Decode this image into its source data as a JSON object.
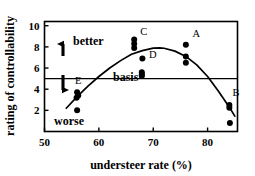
{
  "chart_data": {
    "type": "scatter",
    "title": "",
    "xlabel": "understeer rate (%)",
    "ylabel": "rating of controllability",
    "xlim": [
      50,
      85.5
    ],
    "ylim": [
      0,
      10.4
    ],
    "xticks": [
      50,
      60,
      70,
      80
    ],
    "yticks": [
      2,
      4,
      6,
      8,
      10
    ],
    "xtick_labels": [
      "50",
      "60",
      "70",
      "80"
    ],
    "ytick_labels": [
      "2",
      "4",
      "6",
      "8",
      "10"
    ],
    "grid": false,
    "legend": "none",
    "reference_line": {
      "label": "basis",
      "orientation": "horizontal",
      "y": 5.0
    },
    "direction_annotations": [
      {
        "label": "better",
        "direction": "up"
      },
      {
        "label": "worse",
        "direction": "down"
      }
    ],
    "groups": [
      {
        "name": "E",
        "x": 56.0,
        "values": [
          3.7,
          3.4,
          3.2,
          2.0
        ]
      },
      {
        "name": "C",
        "x": 66.5,
        "values": [
          8.7,
          8.3,
          7.9
        ]
      },
      {
        "name": "D",
        "x": 68.0,
        "values": [
          6.9,
          5.6,
          5.4,
          5.25
        ]
      },
      {
        "name": "A",
        "x": 76.0,
        "values": [
          8.2,
          7.1,
          6.5
        ]
      },
      {
        "name": "B",
        "x": 84.0,
        "values": [
          2.5,
          2.25,
          0.8
        ]
      }
    ],
    "points": [
      {
        "x": 56.0,
        "y": 3.7,
        "group": "E"
      },
      {
        "x": 56.2,
        "y": 3.4,
        "group": "E"
      },
      {
        "x": 55.9,
        "y": 3.2,
        "group": "E"
      },
      {
        "x": 56.0,
        "y": 2.0,
        "group": "E"
      },
      {
        "x": 66.5,
        "y": 8.7,
        "group": "C"
      },
      {
        "x": 66.5,
        "y": 8.3,
        "group": "C"
      },
      {
        "x": 66.5,
        "y": 7.9,
        "group": "C"
      },
      {
        "x": 68.0,
        "y": 6.9,
        "group": "D"
      },
      {
        "x": 67.9,
        "y": 5.6,
        "group": "D"
      },
      {
        "x": 67.9,
        "y": 5.4,
        "group": "D"
      },
      {
        "x": 67.9,
        "y": 5.25,
        "group": "D"
      },
      {
        "x": 76.0,
        "y": 8.2,
        "group": "A"
      },
      {
        "x": 76.0,
        "y": 7.1,
        "group": "A"
      },
      {
        "x": 76.0,
        "y": 6.5,
        "group": "A"
      },
      {
        "x": 84.0,
        "y": 2.5,
        "group": "B"
      },
      {
        "x": 84.0,
        "y": 2.25,
        "group": "B"
      },
      {
        "x": 84.1,
        "y": 0.8,
        "group": "B"
      }
    ],
    "fit_curve": {
      "type": "quadratic",
      "description": "inverted parabola trend line",
      "vertex": [
        71.2,
        7.9
      ],
      "x_start": 54.0,
      "x_end": 85.0,
      "points": [
        [
          54.0,
          2.2
        ],
        [
          56.0,
          3.3
        ],
        [
          58.0,
          4.3
        ],
        [
          60.0,
          5.2
        ],
        [
          62.0,
          6.0
        ],
        [
          64.0,
          6.7
        ],
        [
          66.0,
          7.3
        ],
        [
          68.0,
          7.65
        ],
        [
          70.0,
          7.88
        ],
        [
          71.2,
          7.9
        ],
        [
          72.0,
          7.87
        ],
        [
          74.0,
          7.6
        ],
        [
          76.0,
          7.1
        ],
        [
          78.0,
          6.3
        ],
        [
          80.0,
          5.2
        ],
        [
          82.0,
          3.8
        ],
        [
          84.0,
          2.3
        ],
        [
          85.0,
          1.45
        ]
      ]
    },
    "point_labels": [
      {
        "text": "A",
        "x": 77.2,
        "y": 8.95
      },
      {
        "text": "B",
        "x": 84.6,
        "y": 3.35
      },
      {
        "text": "C",
        "x": 67.6,
        "y": 9.15
      },
      {
        "text": "D",
        "x": 69.2,
        "y": 6.95
      },
      {
        "text": "E",
        "x": 55.6,
        "y": 4.45
      }
    ],
    "colors": {
      "marker": "#000000",
      "curve": "#000000",
      "axis": "#000000",
      "background": "#ffffff"
    }
  }
}
